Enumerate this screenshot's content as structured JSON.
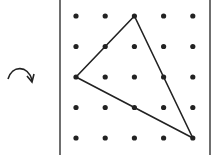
{
  "diagram": {
    "type": "geoboard",
    "grid": {
      "rows": 5,
      "cols": 5
    },
    "rotation_arrow": {
      "direction": "clockwise",
      "icon": "clockwise-arrow-icon"
    },
    "triangle": {
      "vertices": [
        {
          "col": 2,
          "row": 0
        },
        {
          "col": 0,
          "row": 2
        },
        {
          "col": 4,
          "row": 4
        }
      ]
    },
    "colors": {
      "ink": "#222222",
      "background": "#ffffff"
    }
  }
}
